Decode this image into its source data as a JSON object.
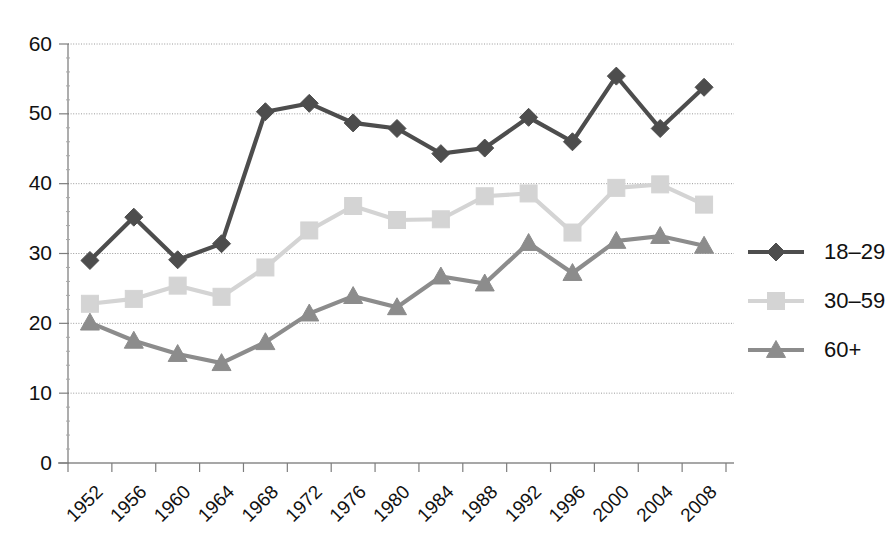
{
  "chart_data": {
    "type": "line",
    "title": "",
    "subtitle": "",
    "xlabel": "",
    "ylabel": "",
    "categories": [
      "1952",
      "1956",
      "1960",
      "1964",
      "1968",
      "1972",
      "1976",
      "1980",
      "1984",
      "1988",
      "1992",
      "1996",
      "2000",
      "2004",
      "2008"
    ],
    "ylim": [
      0,
      60
    ],
    "yticks": [
      0,
      10,
      20,
      30,
      40,
      50,
      60
    ],
    "ytick_labels": [
      "0",
      "10",
      "20",
      "30",
      "40",
      "50",
      "60"
    ],
    "grid": true,
    "grid_axis": "y",
    "legend_position": "right",
    "series": [
      {
        "name": "18–29",
        "marker": "diamond",
        "color": "#4d4d4d",
        "values": [
          29.0,
          35.2,
          29.1,
          31.4,
          50.3,
          51.5,
          48.7,
          47.9,
          44.3,
          45.1,
          49.5,
          46.0,
          55.4,
          47.9,
          53.8
        ]
      },
      {
        "name": "30–59",
        "marker": "square",
        "color": "#d4d4d4",
        "values": [
          22.8,
          23.5,
          25.4,
          23.8,
          28.0,
          33.3,
          36.8,
          34.8,
          34.9,
          38.2,
          38.6,
          33.0,
          39.4,
          39.9,
          37.0
        ]
      },
      {
        "name": "60+",
        "marker": "triangle",
        "color": "#8c8c8c",
        "values": [
          20.1,
          17.5,
          15.6,
          14.3,
          17.3,
          21.4,
          23.9,
          22.3,
          26.7,
          25.7,
          31.5,
          27.2,
          31.8,
          32.5,
          31.1
        ]
      }
    ]
  },
  "legend": {
    "entries": [
      {
        "label": "18–29"
      },
      {
        "label": "30–59"
      },
      {
        "label": "60+"
      }
    ]
  },
  "colors": {
    "series_18_29": "#4d4d4d",
    "series_30_59": "#d4d4d4",
    "series_60_plus": "#8c8c8c",
    "axis": "#8a8a8a",
    "grid": "#9a9a9a",
    "text": "#111111",
    "background": "#ffffff"
  }
}
